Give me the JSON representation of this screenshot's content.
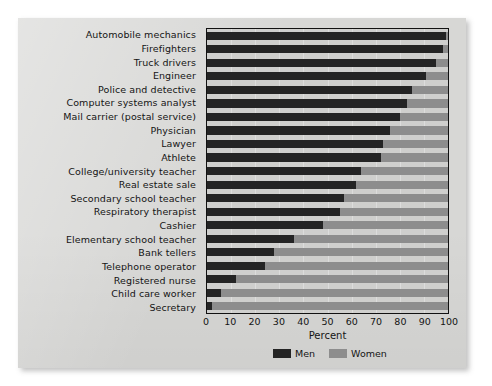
{
  "chart_data": {
    "type": "bar",
    "orientation": "horizontal",
    "stacked": true,
    "title": "",
    "xlabel": "Percent",
    "ylabel": "",
    "xlim": [
      0,
      100
    ],
    "xticks": [
      0,
      10,
      20,
      30,
      40,
      50,
      60,
      70,
      80,
      90,
      100
    ],
    "grid": false,
    "legend_position": "bottom-right",
    "categories": [
      "Automobile mechanics",
      "Firefighters",
      "Truck drivers",
      "Engineer",
      "Police and detective",
      "Computer systems analyst",
      "Mail carrier (postal service)",
      "Physician",
      "Lawyer",
      "Athlete",
      "College/university teacher",
      "Real estate sale",
      "Secondary school teacher",
      "Respiratory therapist",
      "Cashier",
      "Elementary school teacher",
      "Bank tellers",
      "Telephone operator",
      "Registered nurse",
      "Child care worker",
      "Secretary"
    ],
    "series": [
      {
        "name": "Men",
        "color": "#242424",
        "values": [
          99,
          98,
          95,
          91,
          85,
          83,
          80,
          76,
          73,
          72,
          64,
          62,
          57,
          55,
          48,
          36,
          28,
          24,
          12,
          6,
          2
        ]
      },
      {
        "name": "Women",
        "color": "#8d8d8d",
        "values": [
          1,
          2,
          5,
          9,
          15,
          17,
          20,
          24,
          27,
          28,
          36,
          38,
          43,
          45,
          52,
          64,
          72,
          76,
          88,
          94,
          98
        ]
      }
    ]
  },
  "axis": {
    "x_title": "Percent",
    "tick_labels": [
      "0",
      "10",
      "20",
      "30",
      "40",
      "50",
      "60",
      "70",
      "80",
      "90",
      "100"
    ]
  },
  "legend": {
    "items": [
      {
        "label": "Men",
        "color": "#242424"
      },
      {
        "label": "Women",
        "color": "#8d8d8d"
      }
    ]
  },
  "colors": {
    "men": "#242424",
    "women": "#8d8d8d",
    "paper": "#d7d7d5",
    "plot_bg": "#cfcfcd",
    "axis": "#111111",
    "text": "#141414"
  }
}
